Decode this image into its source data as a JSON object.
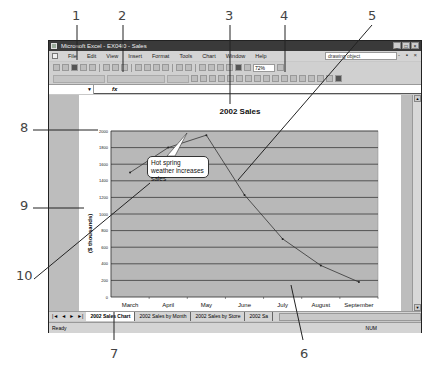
{
  "window": {
    "title": "Microsoft Excel - EX04l0 - Sales",
    "buttons": [
      "_",
      "□",
      "×"
    ]
  },
  "menubar": {
    "items": [
      "File",
      "Edit",
      "View",
      "Insert",
      "Format",
      "Tools",
      "Chart",
      "Window",
      "Help"
    ],
    "object_box": "drawing object",
    "doc_buttons": "- ▪ ×"
  },
  "toolbar": {
    "zoom": "72%"
  },
  "formula_bar": {
    "name_box": "",
    "fx": "fx"
  },
  "chart": {
    "title": "2002 Sales",
    "y_axis_label": "($ thousands)",
    "callout_text": "Hot spring weather increases sales"
  },
  "chart_data": {
    "type": "line",
    "title": "2002 Sales",
    "xlabel": "",
    "ylabel": "($ thousands)",
    "categories": [
      "March",
      "April",
      "May",
      "June",
      "July",
      "August",
      "September"
    ],
    "values": [
      1500,
      1800,
      1950,
      1230,
      700,
      380,
      180
    ],
    "y_ticks": [
      0,
      200,
      400,
      600,
      800,
      1000,
      1200,
      1400,
      1600,
      1800,
      2000
    ],
    "ylim": [
      0,
      2000
    ],
    "grid": true,
    "legend": "none",
    "annotations": [
      "Hot spring weather increases sales"
    ]
  },
  "sheet_tabs": {
    "nav": [
      "|◄",
      "◄",
      "►",
      "►|"
    ],
    "tabs": [
      "2002 Sales Chart",
      "2002 Sales by Month",
      "2002 Sales by Store",
      "2002 Sa"
    ]
  },
  "status": {
    "left": "Ready",
    "num": "NUM"
  },
  "callouts": [
    "1",
    "2",
    "3",
    "4",
    "5",
    "6",
    "7",
    "8",
    "9",
    "10"
  ]
}
